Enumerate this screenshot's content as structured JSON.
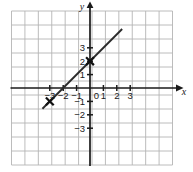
{
  "chart_data": {
    "type": "line",
    "title": "",
    "xlabel": "x",
    "ylabel": "y",
    "xlim": [
      -3.6,
      3.6
    ],
    "ylim": [
      -3.6,
      3.6
    ],
    "grid": true,
    "grid_step": 1,
    "legend": "none",
    "equation": "y = x + 2",
    "slope": 1,
    "intercept": 2,
    "series": [
      {
        "name": "line",
        "x": [
          -3.55,
          2.4
        ],
        "y": [
          -1.55,
          4.4
        ]
      }
    ],
    "marked_points": [
      {
        "label": "(0, 2)",
        "x": 0,
        "y": 2,
        "marker": "x"
      },
      {
        "label": "(-3, -1)",
        "x": -3,
        "y": -1,
        "marker": "x"
      }
    ],
    "x_ticks": [
      -3,
      -2,
      -1,
      0,
      1,
      2,
      3
    ],
    "x_tick_labels": [
      "−3",
      "−2",
      "−1",
      "0",
      "1",
      "2",
      "3"
    ],
    "y_ticks": [
      -3,
      -2,
      -1,
      1,
      2,
      3
    ],
    "y_tick_labels": [
      "−3",
      "−2",
      "−1",
      "1",
      "2",
      "3"
    ],
    "colors": {
      "background": "#ffffff",
      "grid": "#b4b4b4",
      "axis": "#1a1a1a",
      "line": "#2b2b2b",
      "marker": "#111111",
      "label": "#1a1a1a"
    }
  },
  "axes": {
    "x_axis_name": "x",
    "y_axis_name": "y"
  },
  "x_tick_items": [
    {
      "label": "−3",
      "value": -3
    },
    {
      "label": "−2",
      "value": -2
    },
    {
      "label": "−1",
      "value": -1
    },
    {
      "label": "0",
      "value": 0
    },
    {
      "label": "1",
      "value": 1
    },
    {
      "label": "2",
      "value": 2
    },
    {
      "label": "3",
      "value": 3
    }
  ],
  "y_tick_items": [
    {
      "label": "3",
      "value": 3
    },
    {
      "label": "2",
      "value": 2
    },
    {
      "label": "1",
      "value": 1
    },
    {
      "label": "−1",
      "value": -1
    },
    {
      "label": "−2",
      "value": -2
    },
    {
      "label": "−3",
      "value": -3
    }
  ]
}
